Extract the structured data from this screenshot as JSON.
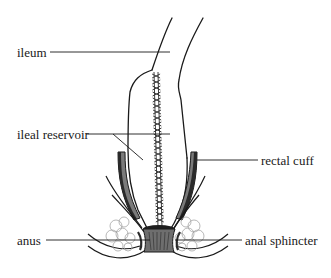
{
  "diagram": {
    "labels": {
      "ileum": "ileum",
      "ileal_reservoir": "ileal reservoir",
      "rectal_cuff": "rectal cuff",
      "anus": "anus",
      "anal_sphincter": "anal sphincter"
    },
    "colors": {
      "line": "#1a1a1a",
      "cuff_dark": "#2a2a2a",
      "cuff_gray": "#7a7a7a",
      "sphincter": "#6e6e6e",
      "fat": "#9a9a9a",
      "background": "#ffffff"
    }
  }
}
